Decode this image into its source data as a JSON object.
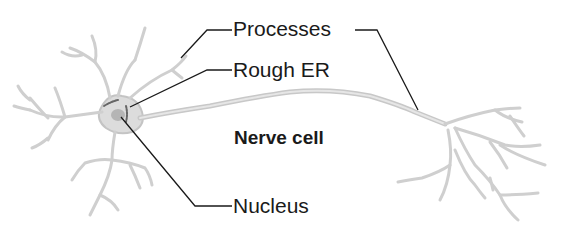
{
  "diagram": {
    "title": "Nerve cell",
    "labels": {
      "processes": "Processes",
      "rough_er": "Rough ER",
      "nucleus": "Nucleus"
    },
    "colors": {
      "cell_fill": "#d9d9d9",
      "cell_stroke": "#bdbdbd",
      "leader_line": "#1a1a1a",
      "text": "#1a1a1a",
      "background": "#ffffff"
    }
  }
}
